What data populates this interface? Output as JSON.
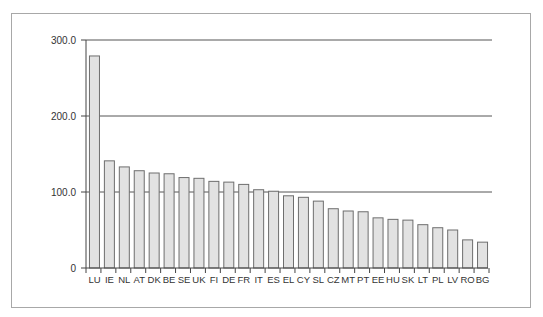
{
  "chart_data": {
    "type": "bar",
    "title": "",
    "xlabel": "",
    "ylabel": "",
    "ylim": [
      0,
      300
    ],
    "yticks": [
      "0",
      "100.0",
      "200.0",
      "300.0"
    ],
    "grid": true,
    "legend": null,
    "categories": [
      "LU",
      "IE",
      "NL",
      "AT",
      "DK",
      "BE",
      "SE",
      "UK",
      "FI",
      "DE",
      "FR",
      "IT",
      "ES",
      "EL",
      "CY",
      "SL",
      "CZ",
      "MT",
      "PT",
      "EE",
      "HU",
      "SK",
      "LT",
      "PL",
      "LV",
      "RO",
      "BG"
    ],
    "values": [
      279,
      141,
      133,
      128,
      125,
      124,
      119,
      118,
      114,
      113,
      110,
      103,
      101,
      95,
      93,
      88,
      78,
      75,
      74,
      66,
      64,
      63,
      57,
      53,
      50,
      37,
      34
    ],
    "colors": {
      "bar_fill": "#e2e2e2",
      "bar_stroke": "#6e6e6e",
      "grid": "#555555",
      "frame": "#a8a8a8"
    }
  }
}
